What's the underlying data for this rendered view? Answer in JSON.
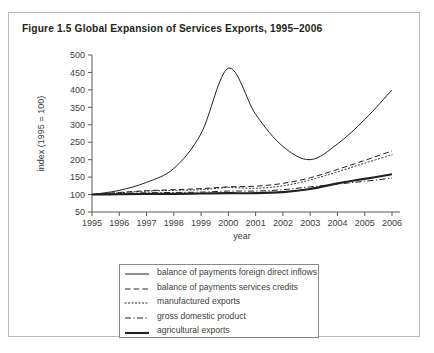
{
  "figure": {
    "title": "Figure 1.5  Global Expansion of Services Exports, 1995–2006"
  },
  "chart_data": {
    "type": "line",
    "title": "Figure 1.5  Global Expansion of Services Exports, 1995–2006",
    "xlabel": "year",
    "ylabel": "index (1995 = 100)",
    "x": [
      1995,
      1996,
      1997,
      1998,
      1999,
      2000,
      2001,
      2002,
      2003,
      2004,
      2005,
      2006
    ],
    "xlim": [
      1995,
      2006
    ],
    "ylim": [
      50,
      500
    ],
    "yticks": [
      50,
      100,
      150,
      200,
      250,
      300,
      350,
      400,
      450,
      500
    ],
    "xticks": [
      "1995",
      "1996",
      "1997",
      "1998",
      "1999",
      "2000",
      "2001",
      "2002",
      "2003",
      "2004",
      "2005",
      "2006"
    ],
    "grid": false,
    "legend_position": "below-axes",
    "series": [
      {
        "name": "balance of payments foreign direct inflows",
        "style": "solid-thin",
        "values": [
          100,
          112,
          135,
          175,
          275,
          462,
          330,
          238,
          200,
          245,
          315,
          400
        ]
      },
      {
        "name": "balance of payments services credits",
        "style": "dashed",
        "values": [
          100,
          106,
          111,
          114,
          117,
          122,
          124,
          132,
          148,
          172,
          198,
          225
        ]
      },
      {
        "name": "manufactured exports",
        "style": "dotted",
        "values": [
          100,
          105,
          110,
          112,
          114,
          120,
          118,
          125,
          142,
          165,
          190,
          214
        ]
      },
      {
        "name": "gross domestic product",
        "style": "dash-dot",
        "values": [
          100,
          103,
          105,
          106,
          107,
          110,
          110,
          114,
          122,
          130,
          138,
          147
        ]
      },
      {
        "name": "agricultural exports",
        "style": "solid-thick",
        "values": [
          100,
          101,
          102,
          102,
          103,
          104,
          104,
          107,
          116,
          132,
          145,
          158
        ]
      }
    ]
  },
  "legend": {
    "items": [
      {
        "label": "balance of payments foreign direct inflows",
        "style": "solid-thin"
      },
      {
        "label": "balance of payments services credits",
        "style": "dashed"
      },
      {
        "label": "manufactured exports",
        "style": "dotted"
      },
      {
        "label": "gross domestic product",
        "style": "dash-dot"
      },
      {
        "label": "agricultural exports",
        "style": "solid-thick"
      }
    ]
  },
  "colors": {
    "ink": "#231f20",
    "axis": "#58595b",
    "frame": "#b9b9b9",
    "legend_border": "#8a8a8a"
  }
}
